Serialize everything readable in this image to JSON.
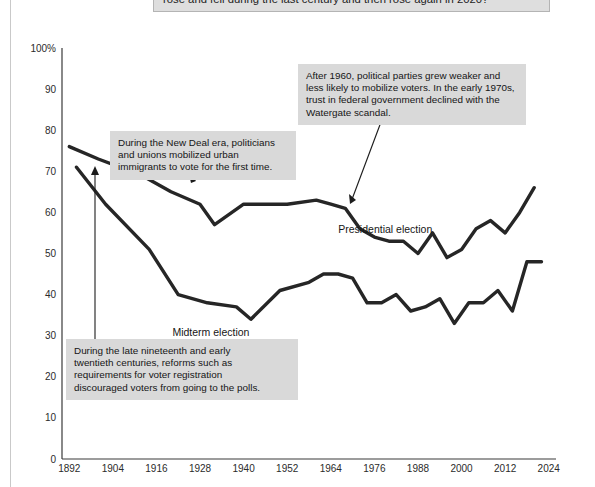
{
  "header": {
    "question": "rose and fell during the last century and then rose again in 2020?"
  },
  "chart_data": {
    "type": "line",
    "title": "",
    "xlabel": "",
    "ylabel": "",
    "xlim": [
      1890,
      2026
    ],
    "ylim": [
      0,
      100
    ],
    "grid": false,
    "legend_position": "inline-labels",
    "y_ticks": [
      "0",
      "10",
      "20",
      "30",
      "40",
      "50",
      "60",
      "70",
      "80",
      "90",
      "100%"
    ],
    "y_tick_values": [
      0,
      10,
      20,
      30,
      40,
      50,
      60,
      70,
      80,
      90,
      100
    ],
    "x_ticks": [
      "1892",
      "1904",
      "1916",
      "1928",
      "1940",
      "1952",
      "1964",
      "1976",
      "1988",
      "2000",
      "2012",
      "2024"
    ],
    "x_tick_values": [
      1892,
      1904,
      1916,
      1928,
      1940,
      1952,
      1964,
      1976,
      1988,
      2000,
      2012,
      2024
    ],
    "series": [
      {
        "name": "Presidential election",
        "label_x": 1979,
        "label_y": 55,
        "color": "#262626",
        "x": [
          1892,
          1900,
          1912,
          1920,
          1928,
          1932,
          1940,
          1948,
          1952,
          1960,
          1964,
          1968,
          1972,
          1976,
          1980,
          1984,
          1988,
          1992,
          1996,
          2000,
          2004,
          2008,
          2012,
          2016,
          2020
        ],
        "y": [
          76,
          73,
          69,
          65,
          62,
          57,
          62,
          62,
          62,
          63,
          62,
          61,
          56,
          54,
          53,
          53,
          50,
          55,
          49,
          51,
          56,
          58,
          55,
          60,
          66
        ]
      },
      {
        "name": "Midterm election",
        "label_x": 1931,
        "label_y": 30,
        "color": "#262626",
        "x": [
          1894,
          1902,
          1914,
          1922,
          1930,
          1938,
          1942,
          1950,
          1958,
          1962,
          1966,
          1970,
          1974,
          1978,
          1982,
          1986,
          1990,
          1994,
          1998,
          2002,
          2006,
          2010,
          2014,
          2018,
          2022
        ],
        "y": [
          71,
          62,
          51,
          40,
          38,
          37,
          34,
          41,
          43,
          45,
          45,
          44,
          38,
          38,
          40,
          36,
          37,
          39,
          33,
          38,
          38,
          41,
          36,
          48,
          48
        ]
      }
    ]
  },
  "annotations": [
    {
      "id": "newdeal",
      "lines": [
        "During the New Deal era, politicians",
        "and unions mobilized urban",
        "immigrants to vote for the first time."
      ]
    },
    {
      "id": "after1960",
      "lines": [
        "After 1960, political parties grew weaker and",
        "less likely to mobilize voters. In the early 1970s,",
        "trust in federal government declined with the",
        "Watergate scandal."
      ]
    },
    {
      "id": "reforms",
      "lines": [
        "During the late nineteenth and early",
        "twentieth centuries, reforms such as",
        "requirements for voter registration",
        "discouraged voters from going to the polls."
      ]
    }
  ]
}
